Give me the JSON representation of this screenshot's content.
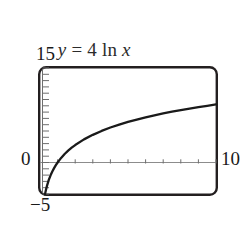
{
  "figure": {
    "title_parts": {
      "y": "y",
      "equals": " = ",
      "coefficient": "4",
      "function": " ln ",
      "x": "x"
    },
    "title_text": "y = 4 ln x",
    "labels": {
      "y_max": "15",
      "y_min": "−5",
      "y_zero": "0",
      "x_max": "10"
    },
    "colors": {
      "background": "#ffffff",
      "frame": "#231f20",
      "curve": "#1a1a1a",
      "axis": "#8c8c8c",
      "tick": "#6e6e6e",
      "text": "#1a1a1a"
    }
  },
  "chart_data": {
    "type": "line",
    "title": "y = 4 ln x",
    "xlabel": "",
    "ylabel": "",
    "xlim": [
      0,
      10
    ],
    "ylim": [
      -5,
      15
    ],
    "grid": false,
    "legend": false,
    "x_tick_labels": [
      "0",
      "10"
    ],
    "y_tick_labels": [
      "−5",
      "0",
      "15"
    ],
    "x_tick_step": 1,
    "y_tick_step": 1,
    "expression": "y = 4*ln(x)",
    "series": [
      {
        "name": "y = 4 ln x",
        "x": [
          0.28,
          0.3,
          0.35,
          0.4,
          0.5,
          0.6,
          0.7,
          0.8,
          0.9,
          1.0,
          1.2,
          1.4,
          1.6,
          1.8,
          2.0,
          2.5,
          3.0,
          3.5,
          4.0,
          4.5,
          5.0,
          5.5,
          6.0,
          6.5,
          7.0,
          7.5,
          8.0,
          8.5,
          9.0,
          9.5,
          10.0
        ],
        "y": [
          -5.09,
          -4.82,
          -4.2,
          -3.67,
          -2.77,
          -2.04,
          -1.43,
          -0.89,
          -0.42,
          0.0,
          0.73,
          1.35,
          1.88,
          2.35,
          2.77,
          3.67,
          4.39,
          5.01,
          5.55,
          6.01,
          6.44,
          6.82,
          7.17,
          7.49,
          7.78,
          8.06,
          8.32,
          8.56,
          8.79,
          9.0,
          9.21
        ]
      }
    ]
  }
}
